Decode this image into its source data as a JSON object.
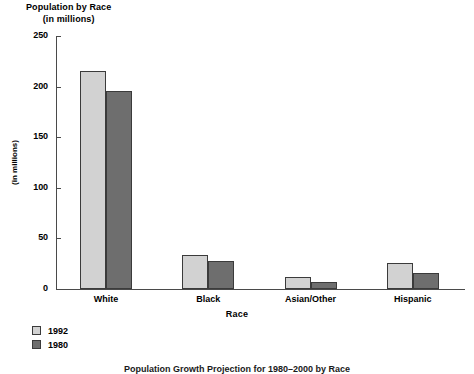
{
  "chart_data": {
    "type": "bar",
    "title": "Population by Race",
    "subtitle": "(in millions)",
    "xlabel": "Race",
    "ylabel": "(in millions)",
    "categories": [
      "White",
      "Black",
      "Asian/Other",
      "Hispanic"
    ],
    "series": [
      {
        "name": "1992",
        "values": [
          215,
          34,
          12,
          26
        ],
        "color": "#d2d2d2"
      },
      {
        "name": "1980",
        "values": [
          196,
          28,
          7,
          16
        ],
        "color": "#6e6e6e"
      }
    ],
    "ylim": [
      0,
      250
    ],
    "yticks": [
      0,
      50,
      100,
      150,
      200,
      250
    ],
    "ytick_labels": [
      "0",
      "50",
      "100",
      "150",
      "200",
      "250"
    ],
    "grid": false,
    "legend_position": "bottom-left"
  },
  "title": {
    "line1": "Population by Race",
    "line2": "(in millions)"
  },
  "axes": {
    "x_title": "Race",
    "y_title": "(in millions)"
  },
  "legend": {
    "entries": [
      {
        "label": "1992",
        "color": "#d2d2d2"
      },
      {
        "label": "1980",
        "color": "#6e6e6e"
      }
    ]
  },
  "caption": {
    "text": "Population Growth Projection for 1980–2000 by Race"
  }
}
